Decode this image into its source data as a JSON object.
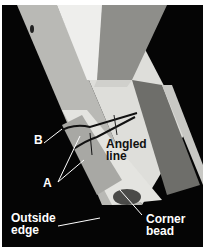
{
  "figure": {
    "labels": {
      "b": "B",
      "a": "A",
      "angled_line": "Angled\nline",
      "outside_edge": "Outside\nedge",
      "corner_bead": "Corner\nbead"
    },
    "colors": {
      "background": "#050505",
      "bead": "#d9d9d6",
      "stud": "#8a8a86",
      "label_text": "#ffffff"
    }
  }
}
